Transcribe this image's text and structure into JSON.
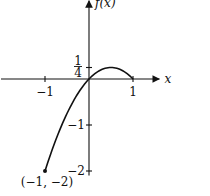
{
  "chart_data": {
    "type": "line",
    "title": "",
    "xlabel": "x",
    "ylabel": "f(x)",
    "function": "x - x^2",
    "domain": [
      -1,
      1
    ],
    "xlim": [
      -2,
      1.6
    ],
    "ylim": [
      -2.1,
      1.7
    ],
    "grid": false,
    "series": [
      {
        "name": "f(x)",
        "x": [
          -1,
          -0.75,
          -0.5,
          -0.25,
          0,
          0.25,
          0.5,
          0.75,
          1
        ],
        "y": [
          -2,
          -1.3125,
          -0.75,
          -0.3125,
          0,
          0.1875,
          0.25,
          0.1875,
          0
        ]
      }
    ],
    "x_ticks": [
      {
        "value": -1,
        "label": "−1"
      },
      {
        "value": 1,
        "label": "1"
      }
    ],
    "y_ticks": [
      {
        "value": 0.25,
        "label_num": "1",
        "label_den": "4"
      },
      {
        "value": -1,
        "label": "−1"
      },
      {
        "value": -2,
        "label": "−2"
      }
    ],
    "annotations": [
      {
        "x": -1,
        "y": -2,
        "text": "(−1, −2)",
        "marker": "dot"
      }
    ]
  }
}
